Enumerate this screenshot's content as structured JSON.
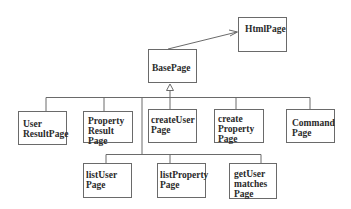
{
  "diagram": {
    "type": "uml-class-hierarchy",
    "nodes": [
      {
        "id": "HtmlPage",
        "label": "HtmlPage",
        "x": 238,
        "y": 17,
        "w": 49,
        "h": 35,
        "tx": 6,
        "ty": 6
      },
      {
        "id": "BasePage",
        "label": "BasePage",
        "x": 148,
        "y": 49,
        "w": 49,
        "h": 34,
        "tx": 3,
        "ty": 14
      },
      {
        "id": "UserResultPage",
        "label": "User\nResultPage",
        "x": 18,
        "y": 111,
        "w": 49,
        "h": 34,
        "tx": 4,
        "ty": 8
      },
      {
        "id": "PropertyResultPage",
        "label": "Property\nResult\nPage",
        "x": 83,
        "y": 111,
        "w": 50,
        "h": 32,
        "tx": 4,
        "ty": 6
      },
      {
        "id": "createUserPage",
        "label": "createUser\nPage",
        "x": 148,
        "y": 109,
        "w": 49,
        "h": 34,
        "tx": 2,
        "ty": 5
      },
      {
        "id": "createPropertyPage",
        "label": "create\nProperty\nPage",
        "x": 214,
        "y": 109,
        "w": 50,
        "h": 34,
        "tx": 3,
        "ty": 5
      },
      {
        "id": "CommandPage",
        "label": "Command\nPage",
        "x": 286,
        "y": 109,
        "w": 49,
        "h": 34,
        "tx": 4,
        "ty": 7
      },
      {
        "id": "listUserPage",
        "label": "listUser\nPage",
        "x": 83,
        "y": 163,
        "w": 49,
        "h": 35,
        "tx": 2,
        "ty": 5
      },
      {
        "id": "listPropertyPage",
        "label": "listProperty\nPage",
        "x": 157,
        "y": 163,
        "w": 49,
        "h": 35,
        "tx": 2,
        "ty": 5
      },
      {
        "id": "getUserMatchesPage",
        "label": "getUser\nmatches\nPage",
        "x": 229,
        "y": 163,
        "w": 48,
        "h": 36,
        "tx": 4,
        "ty": 5
      }
    ],
    "edges": [
      {
        "from": "BasePage",
        "to": "HtmlPage",
        "kind": "association-arrow"
      },
      {
        "from": "UserResultPage",
        "to": "BasePage",
        "kind": "inheritance"
      },
      {
        "from": "PropertyResultPage",
        "to": "BasePage",
        "kind": "inheritance"
      },
      {
        "from": "createUserPage",
        "to": "BasePage",
        "kind": "inheritance"
      },
      {
        "from": "createPropertyPage",
        "to": "BasePage",
        "kind": "inheritance"
      },
      {
        "from": "CommandPage",
        "to": "BasePage",
        "kind": "inheritance"
      },
      {
        "from": "listUserPage",
        "to": "BasePage",
        "kind": "inheritance"
      },
      {
        "from": "listPropertyPage",
        "to": "BasePage",
        "kind": "inheritance"
      },
      {
        "from": "getUserMatchesPage",
        "to": "BasePage",
        "kind": "inheritance"
      }
    ],
    "colors": {
      "line": "#6a6a6a",
      "text": "#2a2a2a",
      "background": "#ffffff"
    }
  }
}
